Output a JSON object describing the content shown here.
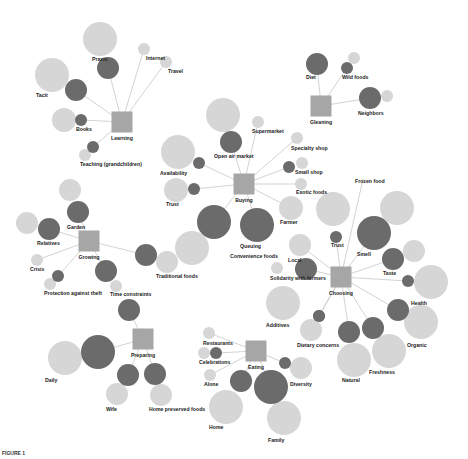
{
  "colors": {
    "hub": "#a6a6a6",
    "dark": "#6b6b6b",
    "light": "#d6d6d6",
    "edge": "#c8c8c8",
    "text": "#222222"
  },
  "caption": "FIGURE 1",
  "hubs": [
    {
      "id": "learning",
      "label": "Learning",
      "x": 122,
      "y": 122,
      "s": 21
    },
    {
      "id": "gleaning",
      "label": "Gleaning",
      "x": 321,
      "y": 106,
      "s": 21
    },
    {
      "id": "buying",
      "label": "Buying",
      "x": 244,
      "y": 184,
      "s": 21
    },
    {
      "id": "growing",
      "label": "Growing",
      "x": 89,
      "y": 241,
      "s": 21
    },
    {
      "id": "choosing",
      "label": "Choosing",
      "x": 341,
      "y": 277,
      "s": 21
    },
    {
      "id": "preparing",
      "label": "Preparing",
      "x": 143,
      "y": 339,
      "s": 21
    },
    {
      "id": "eating",
      "label": "Eating",
      "x": 256,
      "y": 351,
      "s": 21
    }
  ],
  "nodes": [
    {
      "hub": "learning",
      "label": "Praxis",
      "dark": {
        "x": 108,
        "y": 68,
        "r": 11
      },
      "light": {
        "x": 100,
        "y": 39,
        "r": 17
      },
      "lx": 92,
      "ly": 61
    },
    {
      "hub": "learning",
      "label": "Internet",
      "dark": null,
      "light": {
        "x": 144,
        "y": 49,
        "r": 6
      },
      "lx": 146,
      "ly": 60
    },
    {
      "hub": "learning",
      "label": "Travel",
      "dark": null,
      "light": {
        "x": 166,
        "y": 62,
        "r": 6
      },
      "lx": 168,
      "ly": 73
    },
    {
      "hub": "learning",
      "label": "Tacit",
      "dark": {
        "x": 76,
        "y": 90,
        "r": 11
      },
      "light": {
        "x": 52,
        "y": 75,
        "r": 17
      },
      "lx": 36,
      "ly": 97
    },
    {
      "hub": "learning",
      "label": "Books",
      "dark": {
        "x": 81,
        "y": 120,
        "r": 6
      },
      "light": {
        "x": 64,
        "y": 120,
        "r": 12
      },
      "lx": 76,
      "ly": 131
    },
    {
      "hub": "learning",
      "label": "Teaching (grandchildren)",
      "dark": {
        "x": 93,
        "y": 147,
        "r": 6
      },
      "light": {
        "x": 85,
        "y": 155,
        "r": 6
      },
      "lx": 80,
      "ly": 166
    },
    {
      "hub": "gleaning",
      "label": "Diet",
      "dark": {
        "x": 317,
        "y": 64,
        "r": 11
      },
      "light": null,
      "lx": 306,
      "ly": 79
    },
    {
      "hub": "gleaning",
      "label": "Wild foods",
      "dark": {
        "x": 347,
        "y": 68,
        "r": 6
      },
      "light": {
        "x": 354,
        "y": 58,
        "r": 6
      },
      "lx": 342,
      "ly": 79
    },
    {
      "hub": "gleaning",
      "label": "Neighbors",
      "dark": {
        "x": 370,
        "y": 98,
        "r": 11
      },
      "light": {
        "x": 387,
        "y": 96,
        "r": 6
      },
      "lx": 358,
      "ly": 115
    },
    {
      "hub": "buying",
      "label": "Open air market",
      "dark": {
        "x": 231,
        "y": 142,
        "r": 11
      },
      "light": {
        "x": 223,
        "y": 115,
        "r": 17
      },
      "lx": 214,
      "ly": 158
    },
    {
      "hub": "buying",
      "label": "Supermarket",
      "dark": null,
      "light": {
        "x": 258,
        "y": 122,
        "r": 6
      },
      "lx": 252,
      "ly": 133
    },
    {
      "hub": "buying",
      "label": "Specialty shop",
      "dark": null,
      "light": {
        "x": 297,
        "y": 138,
        "r": 6
      },
      "lx": 291,
      "ly": 150
    },
    {
      "hub": "buying",
      "label": "Small shop",
      "dark": {
        "x": 289,
        "y": 167,
        "r": 6
      },
      "light": {
        "x": 302,
        "y": 163,
        "r": 6
      },
      "lx": 295,
      "ly": 174
    },
    {
      "hub": "buying",
      "label": "Exotic foods",
      "dark": null,
      "light": {
        "x": 301,
        "y": 184,
        "r": 6
      },
      "lx": 296,
      "ly": 194
    },
    {
      "hub": "buying",
      "label": "Availability",
      "dark": {
        "x": 199,
        "y": 163,
        "r": 6
      },
      "light": {
        "x": 178,
        "y": 152,
        "r": 17
      },
      "lx": 160,
      "ly": 175
    },
    {
      "hub": "buying",
      "label": "Trust",
      "dark": {
        "x": 194,
        "y": 189,
        "r": 6
      },
      "light": {
        "x": 176,
        "y": 190,
        "r": 12
      },
      "lx": 166,
      "ly": 206
    },
    {
      "hub": "buying",
      "label": "Farmer",
      "dark": null,
      "light": {
        "x": 291,
        "y": 208,
        "r": 12
      },
      "lx": 280,
      "ly": 224
    },
    {
      "hub": "buying",
      "label": "Convenience foods",
      "dark": {
        "x": 214,
        "y": 222,
        "r": 17
      },
      "light": {
        "x": 192,
        "y": 248,
        "r": 17
      },
      "lx": 230,
      "ly": 258
    },
    {
      "hub": "buying",
      "label": "Queuing",
      "dark": {
        "x": 257,
        "y": 225,
        "r": 17
      },
      "light": null,
      "lx": 240,
      "ly": 248
    },
    {
      "hub": "growing",
      "label": "Garden",
      "dark": {
        "x": 78,
        "y": 212,
        "r": 11
      },
      "light": {
        "x": 70,
        "y": 190,
        "r": 11
      },
      "lx": 67,
      "ly": 229
    },
    {
      "hub": "growing",
      "label": "Relatives",
      "dark": {
        "x": 49,
        "y": 229,
        "r": 11
      },
      "light": {
        "x": 27,
        "y": 223,
        "r": 11
      },
      "lx": 37,
      "ly": 245
    },
    {
      "hub": "growing",
      "label": "Crisis",
      "dark": null,
      "light": {
        "x": 37,
        "y": 260,
        "r": 6
      },
      "lx": 30,
      "ly": 271
    },
    {
      "hub": "growing",
      "label": "Protection against theft",
      "dark": {
        "x": 58,
        "y": 276,
        "r": 6
      },
      "light": {
        "x": 50,
        "y": 284,
        "r": 6
      },
      "lx": 44,
      "ly": 295
    },
    {
      "hub": "growing",
      "label": "Time constraints",
      "dark": {
        "x": 106,
        "y": 271,
        "r": 11
      },
      "light": {
        "x": 116,
        "y": 286,
        "r": 6
      },
      "lx": 110,
      "ly": 296
    },
    {
      "hub": "growing",
      "label": "Traditional foods",
      "dark": {
        "x": 146,
        "y": 255,
        "r": 11
      },
      "light": {
        "x": 167,
        "y": 262,
        "r": 11
      },
      "lx": 156,
      "ly": 278
    },
    {
      "hub": "choosing",
      "label": "Frozen food",
      "dark": null,
      "light": null,
      "lx": 355,
      "ly": 183
    },
    {
      "hub": "choosing",
      "label": "Trust",
      "dark": {
        "x": 336,
        "y": 237,
        "r": 6
      },
      "light": {
        "x": 333,
        "y": 209,
        "r": 17
      },
      "lx": 331,
      "ly": 247
    },
    {
      "hub": "choosing",
      "label": "Smell",
      "dark": {
        "x": 374,
        "y": 233,
        "r": 17
      },
      "light": {
        "x": 397,
        "y": 208,
        "r": 17
      },
      "lx": 357,
      "ly": 256
    },
    {
      "hub": "choosing",
      "label": "Taste",
      "dark": {
        "x": 393,
        "y": 259,
        "r": 11
      },
      "light": {
        "x": 414,
        "y": 251,
        "r": 11
      },
      "lx": 383,
      "ly": 275
    },
    {
      "hub": "choosing",
      "label": "Health",
      "dark": {
        "x": 408,
        "y": 281,
        "r": 6
      },
      "light": {
        "x": 431,
        "y": 282,
        "r": 17
      },
      "lx": 411,
      "ly": 305
    },
    {
      "hub": "choosing",
      "label": "Organic",
      "dark": {
        "x": 398,
        "y": 310,
        "r": 11
      },
      "light": {
        "x": 421,
        "y": 322,
        "r": 17
      },
      "lx": 407,
      "ly": 347
    },
    {
      "hub": "choosing",
      "label": "Local",
      "dark": null,
      "light": {
        "x": 300,
        "y": 245,
        "r": 11
      },
      "lx": 288,
      "ly": 262
    },
    {
      "hub": "choosing",
      "label": "Solidarity with farmers",
      "dark": {
        "x": 306,
        "y": 269,
        "r": 11
      },
      "light": {
        "x": 277,
        "y": 268,
        "r": 6
      },
      "lx": 270,
      "ly": 280
    },
    {
      "hub": "choosing",
      "label": "Additives",
      "dark": {
        "x": 319,
        "y": 316,
        "r": 6
      },
      "light": {
        "x": 283,
        "y": 303,
        "r": 17
      },
      "lx": 266,
      "ly": 327
    },
    {
      "hub": "choosing",
      "label": "Dietary concerns",
      "dark": {
        "x": 319,
        "y": 316,
        "r": 6
      },
      "light": {
        "x": 311,
        "y": 330,
        "r": 11
      },
      "lx": 297,
      "ly": 347
    },
    {
      "hub": "choosing",
      "label": "Natural",
      "dark": {
        "x": 349,
        "y": 332,
        "r": 11
      },
      "light": {
        "x": 354,
        "y": 360,
        "r": 17
      },
      "lx": 342,
      "ly": 382
    },
    {
      "hub": "choosing",
      "label": "Freshness",
      "dark": {
        "x": 373,
        "y": 328,
        "r": 11
      },
      "light": {
        "x": 389,
        "y": 351,
        "r": 17
      },
      "lx": 369,
      "ly": 374
    },
    {
      "hub": "preparing",
      "label": "Daily",
      "dark": {
        "x": 98,
        "y": 352,
        "r": 17
      },
      "light": {
        "x": 65,
        "y": 358,
        "r": 17
      },
      "lx": 45,
      "ly": 382
    },
    {
      "hub": "preparing",
      "label": "Time constraints",
      "dark": {
        "x": 129,
        "y": 310,
        "r": 11
      },
      "light": null,
      "lx": null,
      "ly": null
    },
    {
      "hub": "preparing",
      "label": "Wife",
      "dark": {
        "x": 128,
        "y": 375,
        "r": 11
      },
      "light": {
        "x": 117,
        "y": 394,
        "r": 11
      },
      "lx": 106,
      "ly": 411
    },
    {
      "hub": "preparing",
      "label": "Home preserved foods",
      "dark": {
        "x": 155,
        "y": 374,
        "r": 11
      },
      "light": {
        "x": 161,
        "y": 395,
        "r": 11
      },
      "lx": 149,
      "ly": 411
    },
    {
      "hub": "eating",
      "label": "Restaurants",
      "dark": null,
      "light": {
        "x": 209,
        "y": 333,
        "r": 6
      },
      "lx": 203,
      "ly": 345
    },
    {
      "hub": "eating",
      "label": "Celebrations",
      "dark": {
        "x": 216,
        "y": 353,
        "r": 6
      },
      "light": {
        "x": 204,
        "y": 353,
        "r": 6
      },
      "lx": 199,
      "ly": 364
    },
    {
      "hub": "eating",
      "label": "Alone",
      "dark": null,
      "light": {
        "x": 210,
        "y": 375,
        "r": 6
      },
      "lx": 204,
      "ly": 386
    },
    {
      "hub": "eating",
      "label": "Diversity",
      "dark": {
        "x": 285,
        "y": 363,
        "r": 6
      },
      "light": {
        "x": 301,
        "y": 368,
        "r": 11
      },
      "lx": 290,
      "ly": 386
    },
    {
      "hub": "eating",
      "label": "Home",
      "dark": {
        "x": 241,
        "y": 381,
        "r": 11
      },
      "light": {
        "x": 226,
        "y": 407,
        "r": 17
      },
      "lx": 209,
      "ly": 429
    },
    {
      "hub": "eating",
      "label": "Family",
      "dark": {
        "x": 271,
        "y": 387,
        "r": 17
      },
      "light": {
        "x": 284,
        "y": 418,
        "r": 17
      },
      "lx": 268,
      "ly": 442
    }
  ]
}
